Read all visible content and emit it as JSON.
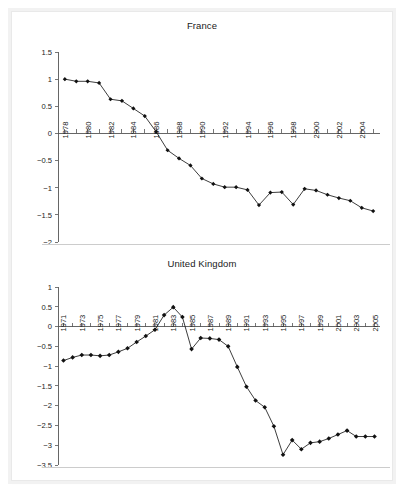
{
  "figure": {
    "background_color": "#ffffff",
    "frame_color": "#e9e9e9",
    "line_color": "#1a1a1a",
    "axis_color": "#555555"
  },
  "chart_data": [
    {
      "type": "line",
      "title": "France",
      "xlabel": "",
      "ylabel": "",
      "xlim": [
        1977.4,
        2005.6
      ],
      "ylim": [
        -2,
        1.5
      ],
      "grid": false,
      "legend": "none",
      "ytick_labels": [
        "1.5",
        "1",
        "0.5",
        "0",
        "-0.5",
        "-1",
        "-1.5",
        "-2"
      ],
      "yticks": [
        1.5,
        1,
        0.5,
        0,
        -0.5,
        -1,
        -1.5,
        -2
      ],
      "xtick_labels": [
        "1978",
        "1980",
        "1982",
        "1984",
        "1986",
        "1988",
        "1990",
        "1992",
        "1994",
        "1996",
        "1998",
        "2000",
        "2002",
        "2004"
      ],
      "xticks": [
        1978,
        1980,
        1982,
        1984,
        1986,
        1988,
        1990,
        1992,
        1994,
        1996,
        1998,
        2000,
        2002,
        2004
      ],
      "x": [
        1978,
        1979,
        1980,
        1981,
        1982,
        1983,
        1984,
        1985,
        1986,
        1987,
        1988,
        1989,
        1990,
        1991,
        1992,
        1993,
        1994,
        1995,
        1996,
        1997,
        1998,
        1999,
        2000,
        2001,
        2002,
        2003,
        2004,
        2005
      ],
      "values": [
        1.0,
        0.96,
        0.96,
        0.93,
        0.63,
        0.6,
        0.46,
        0.32,
        0.03,
        -0.31,
        -0.46,
        -0.59,
        -0.83,
        -0.93,
        -0.99,
        -0.99,
        -1.04,
        -1.32,
        -1.09,
        -1.08,
        -1.31,
        -1.02,
        -1.05,
        -1.13,
        -1.19,
        -1.24,
        -1.37,
        -1.43
      ]
    },
    {
      "type": "line",
      "title": "United Kingdom",
      "xlabel": "",
      "ylabel": "",
      "xlim": [
        1970.4,
        2005.6
      ],
      "ylim": [
        -3.5,
        1
      ],
      "grid": false,
      "legend": "none",
      "ytick_labels": [
        "1",
        "0.5",
        "0",
        "-0.5",
        "-1",
        "-1.5",
        "-2",
        "-2.5",
        "-3",
        "-3.5"
      ],
      "yticks": [
        1,
        0.5,
        0,
        -0.5,
        -1,
        -1.5,
        -2,
        -2.5,
        -3,
        -3.5
      ],
      "xtick_labels": [
        "1971",
        "1973",
        "1975",
        "1977",
        "1979",
        "1981",
        "1983",
        "1985",
        "1987",
        "1989",
        "1991",
        "1993",
        "1995",
        "1997",
        "1999",
        "2001",
        "2003",
        "2005"
      ],
      "xticks": [
        1971,
        1973,
        1975,
        1977,
        1979,
        1981,
        1983,
        1985,
        1987,
        1989,
        1991,
        1993,
        1995,
        1997,
        1999,
        2001,
        2003,
        2005
      ],
      "x": [
        1971,
        1972,
        1973,
        1974,
        1975,
        1976,
        1977,
        1978,
        1979,
        1980,
        1981,
        1982,
        1983,
        1984,
        1985,
        1986,
        1987,
        1988,
        1989,
        1990,
        1991,
        1992,
        1993,
        1994,
        1995,
        1996,
        1997,
        1998,
        1999,
        2000,
        2001,
        2002,
        2003,
        2004,
        2005
      ],
      "values": [
        -0.86,
        -0.78,
        -0.72,
        -0.72,
        -0.74,
        -0.72,
        -0.64,
        -0.55,
        -0.39,
        -0.24,
        -0.08,
        0.29,
        0.49,
        0.24,
        -0.57,
        -0.29,
        -0.3,
        -0.33,
        -0.5,
        -1.02,
        -1.52,
        -1.87,
        -2.04,
        -2.52,
        -3.24,
        -2.87,
        -3.1,
        -2.94,
        -2.91,
        -2.83,
        -2.73,
        -2.63,
        -2.78,
        -2.78,
        -2.78
      ]
    }
  ]
}
